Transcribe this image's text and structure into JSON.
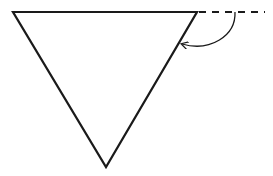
{
  "diagram": {
    "shapes": {
      "triangle": {
        "vertices": [
          [
            13,
            12
          ],
          [
            197,
            12
          ],
          [
            106,
            167
          ]
        ],
        "stroke": "#1a1a1a"
      },
      "extension_line": {
        "from": [
          197,
          12
        ],
        "to": [
          265,
          12
        ],
        "style": "dashed",
        "stroke": "#1a1a1a"
      },
      "angle_arc": {
        "start": [
          235,
          12
        ],
        "end": [
          182,
          44
        ],
        "arrowhead_at": "end",
        "stroke": "#1a1a1a"
      }
    }
  }
}
